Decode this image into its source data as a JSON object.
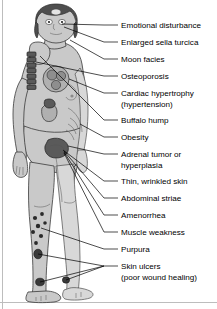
{
  "diagram": {
    "colors": {
      "background": "#ffffff",
      "skin": "#c9c9c9",
      "hair": "#4e4e4e",
      "organ": "#b0b0b0",
      "organ_dark": "#5a5a5a",
      "lesion": "#2a2a2a",
      "text": "#000000",
      "leader_line": "#000000",
      "frame": "#bdbdbd"
    },
    "labels": [
      {
        "id": "emotional-disturbance",
        "lines": [
          "Emotional disturbance"
        ],
        "y": 28,
        "anchor_x": 62,
        "anchor_y": 24
      },
      {
        "id": "enlarged-sella-turcica",
        "lines": [
          "Enlarged sella turcica"
        ],
        "y": 45,
        "anchor_x": 64,
        "anchor_y": 27
      },
      {
        "id": "moon-facies",
        "lines": [
          "Moon facies"
        ],
        "y": 62,
        "anchor_x": 70,
        "anchor_y": 40
      },
      {
        "id": "osteoporosis",
        "lines": [
          "Osteoporosis"
        ],
        "y": 79,
        "anchor_x": 36,
        "anchor_y": 62
      },
      {
        "id": "cardiac-hypertrophy",
        "lines": [
          "Cardiac hypertrophy",
          "(hypertension)"
        ],
        "y": 96,
        "anchor_x": 58,
        "anchor_y": 79
      },
      {
        "id": "buffalo-hump",
        "lines": [
          "Buffalo hump"
        ],
        "y": 123,
        "anchor_x": 34,
        "anchor_y": 56
      },
      {
        "id": "obesity",
        "lines": [
          "Obesity"
        ],
        "y": 140,
        "anchor_x": 78,
        "anchor_y": 121
      },
      {
        "id": "adrenal-tumor-hyperplasia",
        "lines": [
          "Adrenal tumor or",
          "hyperplasia"
        ],
        "y": 157,
        "anchor_x": 62,
        "anchor_y": 148
      },
      {
        "id": "thin-wrinkled-skin",
        "lines": [
          "Thin, wrinkled skin"
        ],
        "y": 184,
        "anchor_x": 63,
        "anchor_y": 150
      },
      {
        "id": "abdominal-striae",
        "lines": [
          "Abdominal striae"
        ],
        "y": 201,
        "anchor_x": 63,
        "anchor_y": 151
      },
      {
        "id": "amenorrhea",
        "lines": [
          "Amenorrhea"
        ],
        "y": 218,
        "anchor_x": 63,
        "anchor_y": 152
      },
      {
        "id": "muscle-weakness",
        "lines": [
          "Muscle weakness"
        ],
        "y": 235,
        "anchor_x": 63,
        "anchor_y": 153
      },
      {
        "id": "purpura",
        "lines": [
          "Purpura"
        ],
        "y": 252,
        "anchor_x": 45,
        "anchor_y": 228
      },
      {
        "id": "skin-ulcers",
        "lines": [
          "Skin ulcers",
          "(poor wound healing)"
        ],
        "y": 269,
        "anchor_x": 46,
        "anchor_y": 253
      }
    ],
    "findings_count": 14,
    "lesions": {
      "purpura_spots": 7,
      "skin_ulcers": 3
    }
  }
}
